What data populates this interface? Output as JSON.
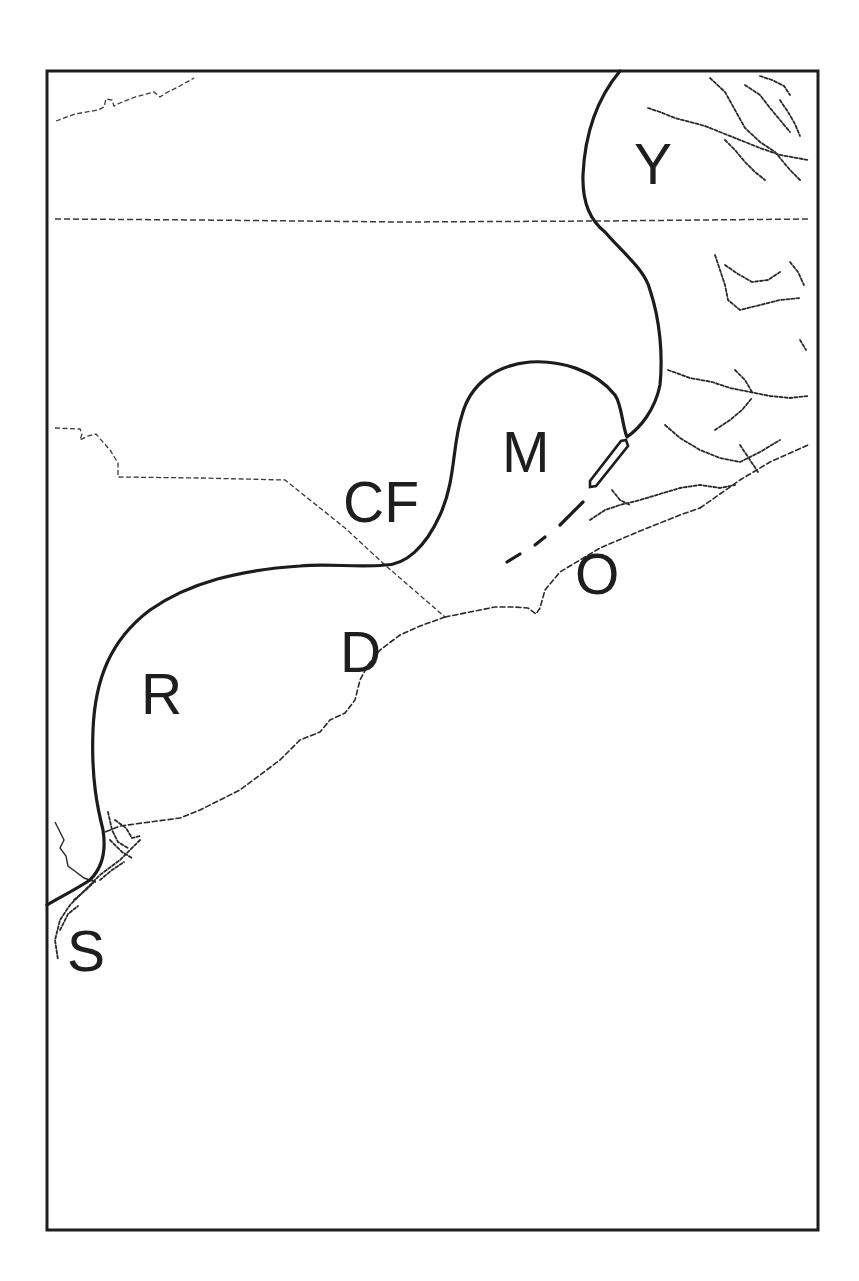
{
  "map": {
    "frame": {
      "left": 47,
      "top": 71,
      "right": 818,
      "bottom": 1230
    },
    "colors": {
      "line": "#1c1c1c",
      "dashed": "#2a2a2a",
      "background": "#ffffff"
    },
    "labels": [
      {
        "id": "Y",
        "text": "Y",
        "x": 634,
        "y": 136
      },
      {
        "id": "M",
        "text": "M",
        "x": 502,
        "y": 424
      },
      {
        "id": "CF",
        "text": "CF",
        "x": 343,
        "y": 474
      },
      {
        "id": "O",
        "text": "O",
        "x": 575,
        "y": 546
      },
      {
        "id": "D",
        "text": "D",
        "x": 340,
        "y": 624
      },
      {
        "id": "R",
        "text": "R",
        "x": 141,
        "y": 666
      },
      {
        "id": "S",
        "text": "S",
        "x": 67,
        "y": 923
      }
    ],
    "layers": {
      "region_boundary": "thick solid line",
      "coastline": "dashed line",
      "state_border": "dashed line",
      "barrier_islands": "outlined ellipses and dashes"
    }
  }
}
